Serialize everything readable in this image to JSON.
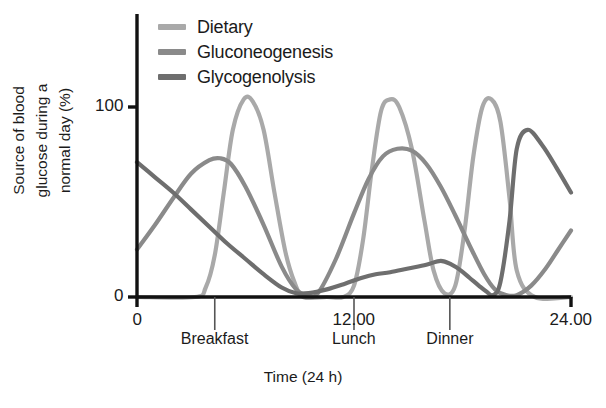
{
  "chart_data": {
    "type": "line",
    "title": "",
    "xlabel": "Time (24 h)",
    "ylabel": "Source of blood glucose during a normal day (%)",
    "ylabel_lines": [
      "Source of blood",
      "glucose during a",
      "normal day (%)"
    ],
    "xlim": [
      0,
      24
    ],
    "ylim": [
      0,
      145
    ],
    "grid": false,
    "legend_position": "top-left",
    "xticks": [
      0,
      12,
      24
    ],
    "xticklabels": [
      "0",
      "12.00",
      "24.00"
    ],
    "yticks": [
      0,
      100
    ],
    "yticklabels": [
      "0",
      "100"
    ],
    "annotations": [
      {
        "label": "Breakfast",
        "x": 4.3
      },
      {
        "label": "Lunch",
        "x": 12.0
      },
      {
        "label": "Dinner",
        "x": 17.3
      }
    ],
    "series": [
      {
        "name": "Dietary",
        "color": "#a9a9a9",
        "x": [
          0,
          3.2,
          3.8,
          4.3,
          4.8,
          5.3,
          5.9,
          6.4,
          7.0,
          7.6,
          8.2,
          8.7,
          9.2,
          10.5,
          11.4,
          12.0,
          12.5,
          13.0,
          13.5,
          14.0,
          14.5,
          15.2,
          15.9,
          16.4,
          17.0,
          17.6,
          18.1,
          18.6,
          19.1,
          19.6,
          20.1,
          20.6,
          21.0,
          22.0,
          24.0
        ],
        "y": [
          0,
          0,
          5,
          22,
          55,
          88,
          104,
          103,
          88,
          55,
          24,
          8,
          0,
          0,
          0,
          6,
          30,
          68,
          98,
          104,
          100,
          78,
          40,
          14,
          2,
          6,
          34,
          74,
          100,
          104,
          92,
          52,
          14,
          0,
          0
        ]
      },
      {
        "name": "Gluconeogenesis",
        "color": "#8a8a8a",
        "x": [
          0,
          1.0,
          2.0,
          3.0,
          4.0,
          4.6,
          5.2,
          6.0,
          7.0,
          8.0,
          8.8,
          9.4,
          10.0,
          11.0,
          12.0,
          12.8,
          13.6,
          14.4,
          15.2,
          16.0,
          16.8,
          17.6,
          18.4,
          19.2,
          19.8,
          20.4,
          21.0,
          21.8,
          22.6,
          23.3,
          24.0
        ],
        "y": [
          25,
          38,
          52,
          65,
          72,
          73,
          70,
          58,
          38,
          16,
          4,
          1,
          2,
          20,
          44,
          62,
          74,
          78,
          77,
          70,
          58,
          43,
          27,
          12,
          4,
          1,
          1,
          6,
          15,
          25,
          35
        ]
      },
      {
        "name": "Glycogenolysis",
        "color": "#6e6e6e",
        "x": [
          0,
          1.0,
          2.0,
          3.0,
          4.0,
          5.0,
          6.0,
          7.0,
          8.0,
          8.8,
          9.5,
          10.5,
          11.5,
          12.4,
          13.2,
          14.0,
          15.0,
          16.0,
          16.8,
          17.4,
          17.9,
          18.4,
          18.9,
          19.3,
          19.7,
          20.1,
          20.6,
          21.0,
          21.6,
          22.4,
          23.2,
          24.0
        ],
        "y": [
          71,
          63,
          55,
          46,
          37,
          28,
          20,
          12,
          5,
          2,
          2,
          4,
          7,
          10,
          12,
          13,
          15,
          17,
          19,
          17,
          14,
          10,
          6,
          3,
          1,
          8,
          40,
          78,
          88,
          80,
          68,
          55
        ]
      }
    ]
  },
  "legend": {
    "items": [
      {
        "label": "Dietary",
        "color": "#a9a9a9"
      },
      {
        "label": "Gluconeogenesis",
        "color": "#8a8a8a"
      },
      {
        "label": "Glycogenolysis",
        "color": "#6e6e6e"
      }
    ]
  },
  "axis": {
    "color": "#111111"
  }
}
